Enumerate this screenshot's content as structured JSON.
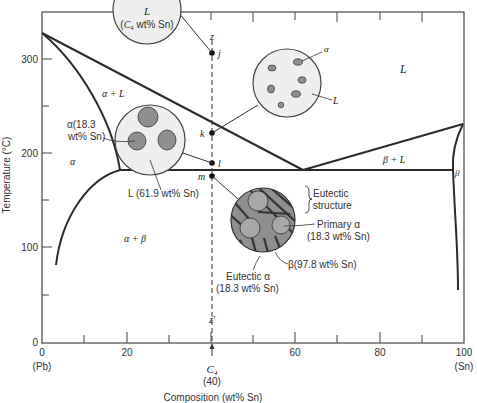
{
  "figure": {
    "type": "phase-diagram",
    "xaxis": {
      "label": "Composition (wt% Sn)",
      "ticks": [
        "0",
        "20",
        "40",
        "60",
        "80",
        "100"
      ],
      "left_end_label": "(Pb)",
      "right_end_label": "(Sn)",
      "marker_label": "C4",
      "marker_value": "(40)"
    },
    "yaxis": {
      "label": "Temperature (°C)",
      "ticks": [
        "0",
        "100",
        "200",
        "300"
      ]
    },
    "regions": {
      "liquid": "L",
      "alpha_plus_liquid": "α + L",
      "alpha": "α",
      "beta_plus_liquid": "β + L",
      "beta": "β",
      "alpha_plus_beta": "α + β"
    },
    "path_points": {
      "z": "z",
      "j": "j",
      "k": "k",
      "l": "l",
      "m": "m",
      "z_prime": "z′"
    },
    "micro_top": {
      "line1": "L",
      "line2": "(C4 wt% Sn)"
    },
    "micro_k": {
      "alpha_label": "α",
      "liquid_label": "L"
    },
    "micro_l": {
      "alpha_label_1": "α(18.3",
      "alpha_label_2": "wt% Sn)",
      "liquid_label": "L (61.9 wt% Sn)"
    },
    "micro_m": {
      "eutectic_structure_1": "Eutectic",
      "eutectic_structure_2": "structure",
      "primary_alpha_1": "Primary α",
      "primary_alpha_2": "(18.3 wt% Sn)",
      "beta_label": "β(97.8 wt% Sn)",
      "eutectic_alpha_1": "Eutectic α",
      "eutectic_alpha_2": "(18.3 wt% Sn)"
    }
  },
  "colors": {
    "phase_gray": "#8f8f8f",
    "circle_fill": "#efefef",
    "line": "#2b2b2b"
  }
}
